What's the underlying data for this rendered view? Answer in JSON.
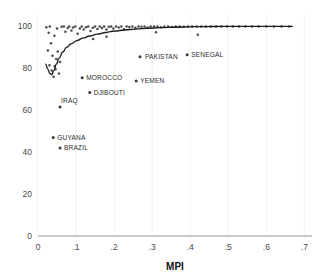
{
  "chart_data": {
    "type": "scatter",
    "title": "",
    "title_clipped": true,
    "xlabel": "MPI",
    "ylabel": "",
    "xlim": [
      0,
      0.72
    ],
    "ylim": [
      0,
      104
    ],
    "x_ticks": [
      0,
      0.1,
      0.2,
      0.3,
      0.4,
      0.5,
      0.6,
      0.7
    ],
    "x_tick_labels": [
      "0",
      ".1",
      ".2",
      ".3",
      ".4",
      ".5",
      ".6",
      ".7"
    ],
    "y_ticks": [
      0,
      20,
      40,
      60,
      80,
      100
    ],
    "y_tick_labels": [
      "0",
      "20",
      "40",
      "60",
      "80",
      "100"
    ],
    "grid": "vertical-only",
    "legend": "none",
    "marker_color": "#3a3a3a",
    "curve_color": "#1c1c1c",
    "grid_color": "#ededf2",
    "axis_color": "#8a8a8a",
    "series": [
      {
        "name": "countries",
        "points": [
          [
            0.022,
            99.6
          ],
          [
            0.028,
            97.0
          ],
          [
            0.031,
            100.0
          ],
          [
            0.034,
            92.0
          ],
          [
            0.026,
            88.5
          ],
          [
            0.038,
            86.0
          ],
          [
            0.03,
            81.5
          ],
          [
            0.036,
            79.0
          ],
          [
            0.041,
            76.0
          ],
          [
            0.044,
            81.0
          ],
          [
            0.048,
            84.5
          ],
          [
            0.052,
            88.0
          ],
          [
            0.046,
            79.5
          ],
          [
            0.055,
            77.5
          ],
          [
            0.058,
            83.0
          ],
          [
            0.043,
            95.5
          ],
          [
            0.05,
            99.0
          ],
          [
            0.062,
            99.8
          ],
          [
            0.068,
            100.0
          ],
          [
            0.072,
            97.5
          ],
          [
            0.078,
            99.2
          ],
          [
            0.082,
            100.0
          ],
          [
            0.088,
            98.0
          ],
          [
            0.092,
            99.5
          ],
          [
            0.098,
            100.0
          ],
          [
            0.104,
            96.5
          ],
          [
            0.11,
            99.0
          ],
          [
            0.115,
            100.0
          ],
          [
            0.12,
            98.5
          ],
          [
            0.126,
            99.6
          ],
          [
            0.132,
            100.0
          ],
          [
            0.138,
            97.8
          ],
          [
            0.144,
            99.4
          ],
          [
            0.15,
            100.0
          ],
          [
            0.156,
            98.8
          ],
          [
            0.162,
            100.0
          ],
          [
            0.168,
            99.2
          ],
          [
            0.174,
            100.0
          ],
          [
            0.18,
            98.5
          ],
          [
            0.186,
            99.8
          ],
          [
            0.192,
            100.0
          ],
          [
            0.198,
            99.0
          ],
          [
            0.205,
            100.0
          ],
          [
            0.212,
            99.5
          ],
          [
            0.219,
            100.0
          ],
          [
            0.226,
            98.6
          ],
          [
            0.233,
            100.0
          ],
          [
            0.24,
            99.7
          ],
          [
            0.248,
            100.0
          ],
          [
            0.256,
            99.3
          ],
          [
            0.264,
            100.0
          ],
          [
            0.272,
            99.8
          ],
          [
            0.28,
            100.0
          ],
          [
            0.288,
            99.5
          ],
          [
            0.296,
            100.0
          ],
          [
            0.305,
            99.9
          ],
          [
            0.314,
            100.0
          ],
          [
            0.323,
            99.6
          ],
          [
            0.332,
            100.0
          ],
          [
            0.342,
            100.0
          ],
          [
            0.352,
            99.7
          ],
          [
            0.362,
            100.0
          ],
          [
            0.372,
            100.0
          ],
          [
            0.383,
            99.8
          ],
          [
            0.394,
            100.0
          ],
          [
            0.405,
            100.0
          ],
          [
            0.417,
            99.9
          ],
          [
            0.429,
            100.0
          ],
          [
            0.441,
            100.0
          ],
          [
            0.454,
            100.0
          ],
          [
            0.468,
            100.0
          ],
          [
            0.482,
            100.0
          ],
          [
            0.497,
            100.0
          ],
          [
            0.512,
            100.0
          ],
          [
            0.528,
            100.0
          ],
          [
            0.545,
            100.0
          ],
          [
            0.562,
            100.0
          ],
          [
            0.58,
            100.0
          ],
          [
            0.6,
            100.0
          ],
          [
            0.62,
            100.0
          ],
          [
            0.64,
            100.0
          ],
          [
            0.66,
            100.0
          ],
          [
            0.42,
            96.0
          ],
          [
            0.31,
            97.2
          ],
          [
            0.18,
            95.0
          ],
          [
            0.145,
            94.0
          ]
        ]
      }
    ],
    "fit_curve": {
      "name": "smoothed fit",
      "points": [
        [
          0.02,
          82.0
        ],
        [
          0.026,
          79.5
        ],
        [
          0.031,
          77.6
        ],
        [
          0.036,
          77.0
        ],
        [
          0.042,
          79.0
        ],
        [
          0.048,
          82.0
        ],
        [
          0.056,
          85.0
        ],
        [
          0.065,
          87.8
        ],
        [
          0.075,
          90.0
        ],
        [
          0.088,
          91.8
        ],
        [
          0.102,
          93.2
        ],
        [
          0.118,
          94.4
        ],
        [
          0.136,
          95.4
        ],
        [
          0.156,
          96.3
        ],
        [
          0.178,
          97.1
        ],
        [
          0.202,
          97.8
        ],
        [
          0.228,
          98.3
        ],
        [
          0.256,
          98.7
        ],
        [
          0.288,
          99.1
        ],
        [
          0.322,
          99.4
        ],
        [
          0.358,
          99.6
        ],
        [
          0.398,
          99.8
        ],
        [
          0.44,
          99.9
        ],
        [
          0.486,
          100.0
        ],
        [
          0.534,
          100.0
        ],
        [
          0.584,
          100.0
        ],
        [
          0.63,
          100.0
        ],
        [
          0.668,
          100.0
        ]
      ]
    },
    "annotations": [
      {
        "label": "PAKISTAN",
        "marker_x": 0.268,
        "marker_y": 85.5,
        "label_dx": 5,
        "label_dy": 2.2,
        "anchor": "start"
      },
      {
        "label": "SENEGAL",
        "marker_x": 0.392,
        "marker_y": 86.5,
        "label_dx": 4,
        "label_dy": 2.2,
        "anchor": "start"
      },
      {
        "label": "MOROCCO",
        "marker_x": 0.116,
        "marker_y": 75.5,
        "label_dx": 4,
        "label_dy": 2.2,
        "anchor": "start"
      },
      {
        "label": "YEMEN",
        "marker_x": 0.258,
        "marker_y": 74.0,
        "label_dx": 4,
        "label_dy": 2.2,
        "anchor": "start"
      },
      {
        "label": "DJIBOUTI",
        "marker_x": 0.136,
        "marker_y": 68.5,
        "label_dx": 4,
        "label_dy": 2.2,
        "anchor": "start"
      },
      {
        "label": "IRAQ",
        "marker_x": 0.058,
        "marker_y": 61.5,
        "label_dx": 1,
        "label_dy": -4.5,
        "anchor": "start"
      },
      {
        "label": "GUYANA",
        "marker_x": 0.04,
        "marker_y": 47.0,
        "label_dx": 4,
        "label_dy": 2.2,
        "anchor": "start"
      },
      {
        "label": "BRAZIL",
        "marker_x": 0.058,
        "marker_y": 42.0,
        "label_dx": 4,
        "label_dy": 2.2,
        "anchor": "start"
      }
    ]
  }
}
